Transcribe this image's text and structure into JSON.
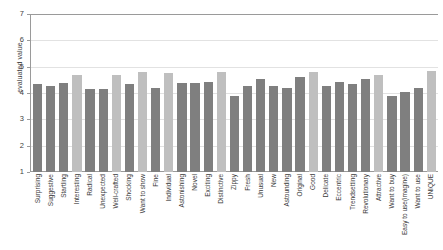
{
  "chart_data": {
    "type": "bar",
    "title": "",
    "xlabel": "",
    "ylabel": "evaluated value",
    "ylim": [
      1,
      7
    ],
    "yticks": [
      1,
      2,
      3,
      4,
      5,
      6,
      7
    ],
    "grid": true,
    "legend": "none",
    "colors": {
      "dark": "#7f7f7f",
      "light": "#bfbfbf",
      "axis": "#9a9a9a",
      "gridline": "#e2e2e2",
      "text": "#3f3f3f",
      "background": "#ffffff"
    },
    "categories": [
      "Surprising",
      "Suggestive",
      "Startling",
      "Interesting",
      "Radical",
      "Unexpected",
      "Well-crafted",
      "Shocking",
      "Want to show",
      "Fine",
      "Individual",
      "Astonishing",
      "Novel",
      "Exciting",
      "Distinctive",
      "Zippy",
      "Fresh",
      "Unusual",
      "New",
      "Astounding",
      "Original",
      "Good",
      "Delicate",
      "Eccentric",
      "Trendsetting",
      "Revolutionary",
      "Attractive",
      "Want to buy",
      "Easy to use(imagine)",
      "Want to use",
      "UNIQUE"
    ],
    "values": [
      4.35,
      4.25,
      4.38,
      4.7,
      4.15,
      4.15,
      4.7,
      4.35,
      4.8,
      4.18,
      4.75,
      4.38,
      4.37,
      4.42,
      4.78,
      3.88,
      4.25,
      4.55,
      4.28,
      4.2,
      4.62,
      4.8,
      4.28,
      4.42,
      4.33,
      4.55,
      4.7,
      3.9,
      4.02,
      4.2,
      4.85
    ],
    "bar_shades": [
      "dark",
      "dark",
      "dark",
      "light",
      "dark",
      "dark",
      "light",
      "dark",
      "light",
      "dark",
      "light",
      "dark",
      "dark",
      "dark",
      "light",
      "dark",
      "dark",
      "dark",
      "dark",
      "dark",
      "dark",
      "light",
      "dark",
      "dark",
      "dark",
      "dark",
      "light",
      "dark",
      "dark",
      "dark",
      "light"
    ]
  }
}
